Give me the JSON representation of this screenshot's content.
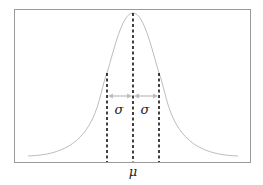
{
  "diagram": {
    "labels": {
      "mean": "μ",
      "sigma_left": "σ",
      "sigma_right": "σ"
    },
    "colors": {
      "frame": "#9a9a9a",
      "curve": "#bdbdbd",
      "dashed_lines": "#111111",
      "arrows": "#bdbdbd",
      "text": "#222222"
    },
    "geometry": {
      "frame": {
        "x": 14,
        "y": 9,
        "width": 236,
        "height": 153
      },
      "peak": {
        "x": 133,
        "y": 13
      },
      "baseline_y": 162,
      "mean_x": 133,
      "sigma_left_x": 107,
      "sigma_right_x": 159,
      "sigma_marker_top_y": 73,
      "arrow_y": 96
    }
  }
}
